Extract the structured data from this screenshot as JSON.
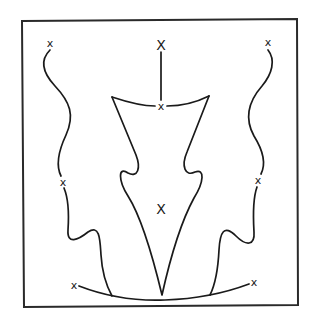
{
  "diagram": {
    "title": "",
    "line_color": "#1a1a1a",
    "background": "#ffffff",
    "markers": [
      {
        "id": "top-left",
        "label": "x"
      },
      {
        "id": "top-center",
        "label": "X"
      },
      {
        "id": "upper-center",
        "label": "x"
      },
      {
        "id": "top-right",
        "label": "x"
      },
      {
        "id": "mid-left",
        "label": "x"
      },
      {
        "id": "center",
        "label": "X"
      },
      {
        "id": "mid-right",
        "label": "x"
      },
      {
        "id": "bottom-left",
        "label": "x"
      },
      {
        "id": "bottom-right",
        "label": "x"
      }
    ],
    "strokes": [
      "left-wavy-curve",
      "right-wavy-curve",
      "center-vertical-line",
      "top-bar-arc",
      "central-funnel-shape",
      "bottom-arc"
    ]
  }
}
